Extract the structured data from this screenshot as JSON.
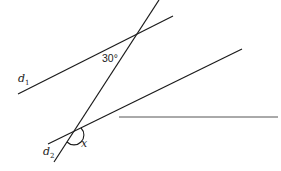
{
  "diagram": {
    "type": "geometry",
    "colors": {
      "line": "#1a1a1a",
      "horizontal_line": "#555555",
      "text": "#222222"
    },
    "lines": {
      "transversal": {
        "x1": 159,
        "y1": 0,
        "x2": 54,
        "y2": 162
      },
      "d1": {
        "x1": 18,
        "y1": 94,
        "x2": 173,
        "y2": 16
      },
      "d2": {
        "x1": 48,
        "y1": 144,
        "x2": 242,
        "y2": 49
      },
      "horizontal": {
        "x1": 119,
        "y1": 117,
        "x2": 278,
        "y2": 117
      }
    },
    "labels": {
      "d1": {
        "letter": "d",
        "sub": "1"
      },
      "d2": {
        "letter": "d",
        "sub": "2"
      },
      "angle_given": "30°",
      "angle_unknown": "x"
    }
  }
}
